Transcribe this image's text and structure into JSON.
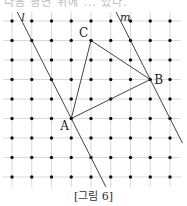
{
  "header": {
    "clipped_text": "다음 평면 위에 ... 있다."
  },
  "diagram": {
    "grid": {
      "columns": 9,
      "rows": 9
    },
    "points": [
      {
        "label": "A",
        "col": 3,
        "row": 5
      },
      {
        "label": "B",
        "col": 7,
        "row": 3
      },
      {
        "label": "C",
        "col": 4,
        "row": 1
      }
    ],
    "segments": [
      [
        "A",
        "B"
      ],
      [
        "B",
        "C"
      ],
      [
        "C",
        "A"
      ]
    ],
    "lines": [
      {
        "label": "l",
        "through": [
          [
            1,
            1
          ],
          [
            3,
            5
          ]
        ]
      },
      {
        "label": "m",
        "through": [
          [
            6,
            1
          ],
          [
            7,
            3
          ]
        ]
      }
    ],
    "colors": {
      "grid": "#cfcfcf",
      "dot": "#111111",
      "line": "#444444"
    }
  },
  "caption": "[그림 6]"
}
